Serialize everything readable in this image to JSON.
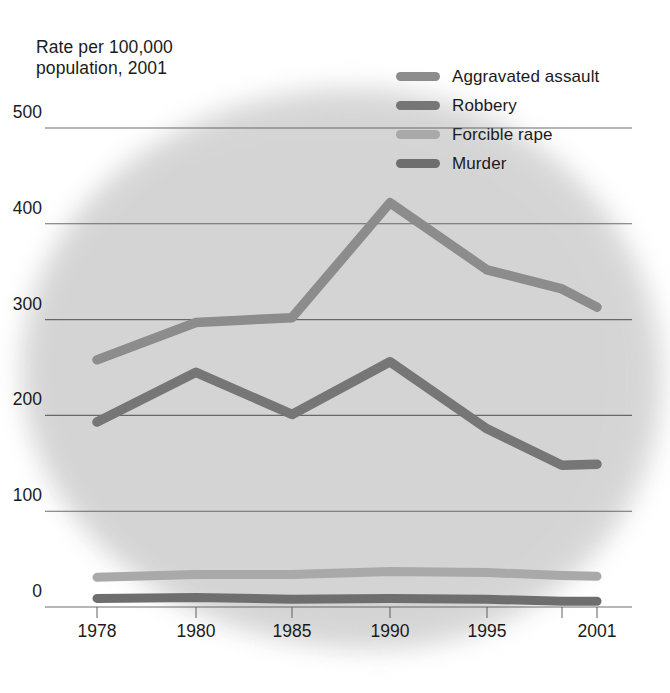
{
  "chart_data": {
    "type": "line",
    "title": "Rate per 100,000\npopulation, 2001",
    "xlabel": "",
    "ylabel": "Rate per 100,000 population",
    "x": [
      1978,
      1980,
      1985,
      1990,
      1995,
      1998,
      2001
    ],
    "xtick_labels": [
      "1978",
      "1980",
      "1985",
      "1990",
      "1995",
      "2001"
    ],
    "xtick_values": [
      1978,
      1980,
      1985,
      1990,
      1995,
      2001
    ],
    "ytick_labels": [
      "0",
      "100",
      "200",
      "300",
      "400",
      "500"
    ],
    "ytick_values": [
      0,
      100,
      200,
      300,
      400,
      500
    ],
    "ylim": [
      0,
      500
    ],
    "grid": "horizontal",
    "legend_position": "top-right",
    "series": [
      {
        "name": "Aggravated assault",
        "color": "#8c8c8c",
        "values": [
          258,
          297,
          302,
          422,
          352,
          332,
          313
        ]
      },
      {
        "name": "Robbery",
        "color": "#767676",
        "values": [
          193,
          245,
          201,
          256,
          186,
          148,
          149
        ]
      },
      {
        "name": "Forcible rape",
        "color": "#a9a9a9",
        "values": [
          31,
          34,
          34,
          37,
          36,
          33,
          32
        ]
      },
      {
        "name": "Murder",
        "color": "#6e6e6e",
        "values": [
          9,
          10,
          8,
          9,
          8,
          6,
          6
        ]
      }
    ]
  },
  "legend": {
    "items": [
      {
        "label": "Aggravated assault",
        "color": "#8c8c8c"
      },
      {
        "label": "Robbery",
        "color": "#767676"
      },
      {
        "label": "Forcible rape",
        "color": "#a9a9a9"
      },
      {
        "label": "Murder",
        "color": "#6e6e6e"
      }
    ]
  },
  "axis": {
    "title_line1": "Rate per 100,000",
    "title_line2": "population, 2001"
  },
  "colors": {
    "background": "#ffffff",
    "blob": "#d4d4d4",
    "gridline": "#555555",
    "text": "#1b1b1b"
  }
}
